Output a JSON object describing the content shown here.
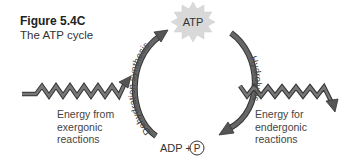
{
  "figure": {
    "number": "Figure 5.4C",
    "caption": "The ATP cycle"
  },
  "nodes": {
    "top": "ATP",
    "bottom_left": "ADP +",
    "bottom_circle": "P"
  },
  "processes": {
    "left_arc": "Dehydration synthesis",
    "right_arc": "Hydrolysis"
  },
  "energy": {
    "input": [
      "Energy from",
      "exergonic",
      "reactions"
    ],
    "output": [
      "Energy for",
      "endergonic",
      "reactions"
    ]
  },
  "colors": {
    "arrow": "#555555",
    "arrow_outline": "#333333",
    "starburst": "#d9d9d9",
    "text": "#444444"
  }
}
